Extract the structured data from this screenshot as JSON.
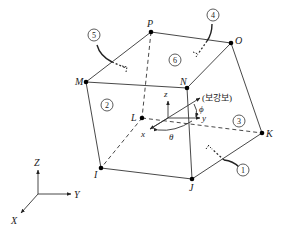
{
  "diagram": {
    "type": "hexahedral solid element with local rebar coordinate system",
    "nodes": [
      {
        "id": "M",
        "x": 86,
        "y": 82
      },
      {
        "id": "P",
        "x": 151,
        "y": 32
      },
      {
        "id": "O",
        "x": 231,
        "y": 43
      },
      {
        "id": "N",
        "x": 187,
        "y": 88
      },
      {
        "id": "L",
        "x": 142,
        "y": 118
      },
      {
        "id": "I",
        "x": 101,
        "y": 168
      },
      {
        "id": "J",
        "x": 192,
        "y": 179
      },
      {
        "id": "K",
        "x": 262,
        "y": 133
      }
    ],
    "faces": [
      {
        "label": "1"
      },
      {
        "label": "2"
      },
      {
        "label": "3"
      },
      {
        "label": "4"
      },
      {
        "label": "5"
      },
      {
        "label": "6"
      }
    ],
    "local_axes": {
      "x": "x",
      "y": "y",
      "z": "z",
      "theta": "θ",
      "phi": "ϕ",
      "rebar_label": "(보강보)"
    },
    "global_axes": {
      "X": "X",
      "Y": "Y",
      "Z": "Z"
    }
  }
}
